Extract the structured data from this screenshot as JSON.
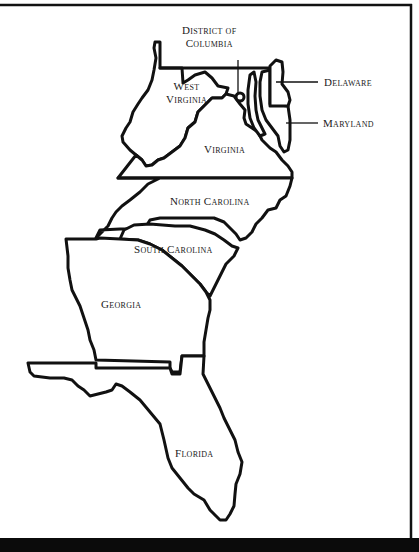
{
  "map": {
    "title": "Southeastern United States",
    "colors": {
      "stroke": "#111111",
      "fill": "#ffffff",
      "band": "#0b0b0b"
    },
    "labels": {
      "dc_line1": "District of",
      "dc_line2": "Columbia",
      "delaware": "Delaware",
      "maryland": "Maryland",
      "west_virginia_line1": "West",
      "west_virginia_line2": "Virginia",
      "virginia": "Virginia",
      "north_carolina": "North Carolina",
      "south_carolina": "South Carolina",
      "georgia": "Georgia",
      "florida": "Florida"
    }
  }
}
